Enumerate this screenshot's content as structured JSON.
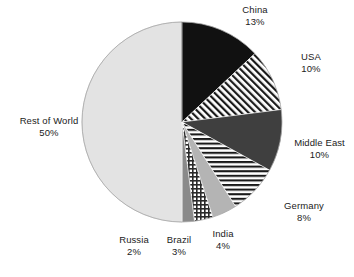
{
  "chart_data": {
    "type": "pie",
    "title": "",
    "subtitle": "",
    "xlabel": "",
    "ylabel": "",
    "legend_position": "none",
    "grid": false,
    "start_angle_deg": 0,
    "direction": "clockwise",
    "units": "%",
    "categories": [
      "China",
      "USA",
      "Middle East",
      "Germany",
      "India",
      "Brazil",
      "Russia",
      "Rest of World"
    ],
    "values": [
      13,
      10,
      10,
      8,
      4,
      3,
      2,
      50
    ],
    "labels": [
      "13%",
      "10%",
      "10%",
      "8%",
      "4%",
      "3%",
      "2%",
      "50%"
    ],
    "total": 100,
    "slices": [
      {
        "name": "China",
        "value": 13,
        "label": "13%",
        "fill": "solid",
        "color": "#111111",
        "pattern": "none"
      },
      {
        "name": "USA",
        "value": 10,
        "label": "10%",
        "fill": "pattern",
        "color": "#1a1a1a",
        "pattern": "diagonal-stripes"
      },
      {
        "name": "Middle East",
        "value": 10,
        "label": "10%",
        "fill": "solid",
        "color": "#3f3f3f",
        "pattern": "none"
      },
      {
        "name": "Germany",
        "value": 8,
        "label": "8%",
        "fill": "pattern",
        "color": "#1a1a1a",
        "pattern": "horizontal-stripes"
      },
      {
        "name": "India",
        "value": 4,
        "label": "4%",
        "fill": "solid",
        "color": "#b4b4b4",
        "pattern": "none"
      },
      {
        "name": "Brazil",
        "value": 3,
        "label": "3%",
        "fill": "pattern",
        "color": "#2a2a2a",
        "pattern": "crosshatch-grid"
      },
      {
        "name": "Russia",
        "value": 2,
        "label": "2%",
        "fill": "solid",
        "color": "#8a8a8a",
        "pattern": "none"
      },
      {
        "name": "Rest of World",
        "value": 50,
        "label": "50%",
        "fill": "solid",
        "color": "#e3e3e3",
        "pattern": "none"
      }
    ]
  },
  "labels": {
    "china": {
      "name": "China",
      "pct": "13%"
    },
    "usa": {
      "name": "USA",
      "pct": "10%"
    },
    "middle_east": {
      "name": "Middle East",
      "pct": "10%"
    },
    "germany": {
      "name": "Germany",
      "pct": "8%"
    },
    "india": {
      "name": "India",
      "pct": "4%"
    },
    "brazil": {
      "name": "Brazil",
      "pct": "3%"
    },
    "russia": {
      "name": "Russia",
      "pct": "2%"
    },
    "rest": {
      "name": "Rest of World",
      "pct": "50%"
    }
  },
  "geometry": {
    "center_x": 182,
    "center_y": 122,
    "radius": 100
  },
  "colors": {
    "background": "#ffffff",
    "text": "#1b1b1b",
    "outline": "#9a9a9a",
    "black": "#111111",
    "dark_gray": "#3f3f3f",
    "mid_gray": "#8a8a8a",
    "light_gray": "#b4b4b4",
    "pale_gray": "#e3e3e3"
  }
}
